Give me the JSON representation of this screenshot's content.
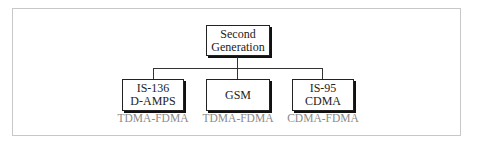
{
  "diagram": {
    "root": {
      "lines": [
        "Second",
        "Generation"
      ]
    },
    "children": [
      {
        "lines": [
          "IS-136",
          "D-AMPS"
        ],
        "access": "TDMA-FDMA"
      },
      {
        "lines": [
          "GSM"
        ],
        "access": "TDMA-FDMA"
      },
      {
        "lines": [
          "IS-95",
          "CDMA"
        ],
        "access": "CDMA-FDMA"
      }
    ]
  },
  "colors": {
    "border": "#222222",
    "subtitle": "#8a8a8a",
    "frame": "#c8c8c8"
  }
}
